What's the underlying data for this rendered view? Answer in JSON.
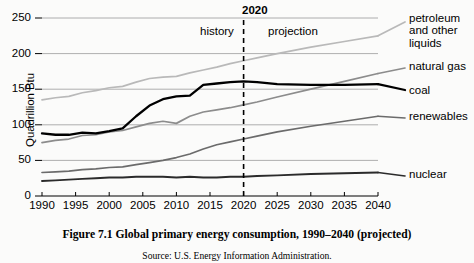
{
  "figure": {
    "caption": "Figure 7.1  Global primary energy consumption, 1990–2040 (projected)",
    "source": "Source: U.S. Energy Information Administration."
  },
  "axes": {
    "ylabel": "Quadrillion Btu",
    "yticks": [
      "250",
      "200",
      "150",
      "100",
      "50",
      "0"
    ],
    "xticks": [
      "1990",
      "1995",
      "2000",
      "2005",
      "2010",
      "2015",
      "2020",
      "2025",
      "2030",
      "2035",
      "2040"
    ]
  },
  "annotations": {
    "divider_year": "2020",
    "history_label": "history",
    "projection_label": "projection"
  },
  "series_labels": {
    "petroleum": "petroleum\nand other\nliquids",
    "natural_gas": "natural gas",
    "coal": "coal",
    "renewables": "renewables",
    "nuclear": "nuclear"
  },
  "chart_data": {
    "type": "line",
    "title": "Global primary energy consumption, 1990–2040 (projected)",
    "xlabel": "",
    "ylabel": "Quadrillion Btu",
    "xlim": [
      1990,
      2040
    ],
    "ylim": [
      0,
      250
    ],
    "grid": true,
    "legend_position": "right-of-plot-inline",
    "x": [
      1990,
      1992,
      1994,
      1996,
      1998,
      2000,
      2002,
      2004,
      2006,
      2008,
      2010,
      2012,
      2014,
      2016,
      2018,
      2020,
      2022,
      2025,
      2030,
      2035,
      2040
    ],
    "divider_x": 2020,
    "series": [
      {
        "name": "petroleum and other liquids",
        "color": "#b9b9b9",
        "values": [
          135,
          138,
          140,
          145,
          148,
          152,
          154,
          160,
          165,
          167,
          168,
          173,
          177,
          181,
          186,
          190,
          194,
          200,
          209,
          217,
          225
        ]
      },
      {
        "name": "natural gas",
        "color": "#8c8c8c",
        "values": [
          75,
          78,
          80,
          85,
          86,
          90,
          92,
          97,
          102,
          105,
          102,
          112,
          118,
          121,
          124,
          128,
          132,
          139,
          150,
          161,
          172
        ]
      },
      {
        "name": "coal",
        "color": "#000000",
        "values": [
          88,
          86,
          86,
          89,
          88,
          91,
          95,
          112,
          127,
          136,
          140,
          141,
          156,
          158,
          160,
          161,
          160,
          157,
          156,
          156,
          157
        ]
      },
      {
        "name": "renewables",
        "color": "#6b6b6b",
        "values": [
          33,
          34,
          35,
          37,
          38,
          40,
          41,
          44,
          47,
          50,
          54,
          59,
          66,
          72,
          76,
          80,
          84,
          90,
          98,
          105,
          112
        ]
      },
      {
        "name": "nuclear",
        "color": "#2b2b2b",
        "values": [
          21,
          22,
          23,
          24,
          25,
          26,
          26,
          27,
          27,
          27,
          26,
          27,
          26,
          26,
          27,
          27,
          28,
          29,
          31,
          32,
          33
        ]
      }
    ]
  }
}
